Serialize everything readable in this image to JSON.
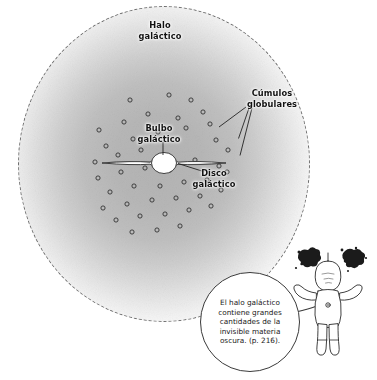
{
  "figure": {
    "kind": "galaxy-structure-diagram",
    "language": "es",
    "labels": {
      "halo": "Halo\ngaláctico",
      "clusters": "Cúmulos\nglobulares",
      "bulge": "Bulbo\ngaláctico",
      "disk": "Disco\ngaláctico"
    },
    "callout": {
      "text": "El halo galáctico\ncontiene grandes\ncantidades de la\ninvisible materia\noscura. (p. 216).",
      "speaker": "astronaut-character"
    },
    "character": {
      "name": "astronaut",
      "pose": "arms-raised",
      "holding": "dark-matter-blobs"
    },
    "colors": {
      "halo_core": "#b4b4b4",
      "halo_edge": "#ffffff",
      "halo_boundary": "#6d6d6d",
      "ink": "#111111",
      "bubble_border": "#3a3a3a",
      "dark_matter": "#1b1b1b"
    },
    "halo_boundary_style": "dotted-circle",
    "cluster_marker": "small-open-circle",
    "cluster_count": 44
  },
  "chart_data": {
    "type": "scatter",
    "xlabel": "",
    "ylabel": "",
    "grid": false,
    "legend": "none",
    "components": [
      {
        "name": "Halo galáctico",
        "shape": "sphere-gradient",
        "cx": 164,
        "cy": 164,
        "rx": 146,
        "ry": 158
      },
      {
        "name": "Bulbo galáctico",
        "shape": "ellipse",
        "cx": 164,
        "cy": 163,
        "rx": 13,
        "ry": 11
      },
      {
        "name": "Disco galáctico",
        "shape": "lens",
        "cx": 164,
        "cy": 163,
        "rx": 62,
        "ry": 5
      }
    ],
    "series": [
      {
        "name": "Cúmulos globulares",
        "marker": "open-circle",
        "points": [
          [
            130,
            100
          ],
          [
            169,
            95
          ],
          [
            191,
            100
          ],
          [
            99,
            130
          ],
          [
            124,
            122
          ],
          [
            148,
            114
          ],
          [
            178,
            118
          ],
          [
            203,
            112
          ],
          [
            106,
            146
          ],
          [
            133,
            139
          ],
          [
            158,
            132
          ],
          [
            186,
            128
          ],
          [
            210,
            124
          ],
          [
            95,
            162
          ],
          [
            118,
            155
          ],
          [
            141,
            150
          ],
          [
            216,
            140
          ],
          [
            228,
            150
          ],
          [
            98,
            178
          ],
          [
            121,
            172
          ],
          [
            145,
            168
          ],
          [
            170,
            170
          ],
          [
            195,
            160
          ],
          [
            219,
            166
          ],
          [
            110,
            192
          ],
          [
            134,
            186
          ],
          [
            160,
            186
          ],
          [
            184,
            182
          ],
          [
            207,
            180
          ],
          [
            227,
            172
          ],
          [
            103,
            208
          ],
          [
            127,
            204
          ],
          [
            152,
            200
          ],
          [
            176,
            198
          ],
          [
            200,
            196
          ],
          [
            221,
            190
          ],
          [
            116,
            220
          ],
          [
            140,
            216
          ],
          [
            165,
            214
          ],
          [
            189,
            210
          ],
          [
            211,
            206
          ],
          [
            132,
            232
          ],
          [
            157,
            230
          ],
          [
            180,
            226
          ]
        ]
      }
    ],
    "annotations": [
      {
        "text": "Halo\ngaláctico",
        "x": 160,
        "y": 28,
        "anchor": "middle"
      },
      {
        "text": "Cúmulos\ngoblulares",
        "x": 271,
        "y": 96,
        "anchor": "middle"
      },
      {
        "text": "Bulbo\ngaláctico",
        "x": 159,
        "y": 131,
        "anchor": "middle"
      },
      {
        "text": "Disco\ngaláctico",
        "x": 214,
        "y": 176,
        "anchor": "middle"
      }
    ],
    "leader_lines": [
      {
        "from": [
          245,
          107
        ],
        "to": [
          218,
          128
        ]
      },
      {
        "from": [
          249,
          108
        ],
        "to": [
          238,
          139
        ]
      },
      {
        "from": [
          253,
          108
        ],
        "to": [
          240,
          156
        ]
      },
      {
        "from": [
          163,
          142
        ],
        "to": [
          163,
          156
        ]
      },
      {
        "from": [
          206,
          172
        ],
        "to": [
          178,
          163
        ]
      }
    ]
  }
}
